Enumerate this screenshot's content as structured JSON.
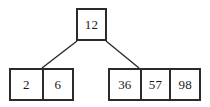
{
  "diagram": {
    "type": "b-tree",
    "colors": {
      "background": "#ffffff",
      "border": "#2b2b2b",
      "text": "#1a1a1a",
      "edge": "#2b2b2b"
    },
    "nodes": [
      {
        "id": "root",
        "role": "root-node",
        "keys": [
          "12"
        ]
      },
      {
        "id": "leaf-left",
        "role": "leaf-node",
        "keys": [
          "2",
          "6"
        ]
      },
      {
        "id": "leaf-right",
        "role": "leaf-node",
        "keys": [
          "36",
          "57",
          "98"
        ]
      }
    ],
    "edges": [
      {
        "id": "edge-root-to-left",
        "from": "root",
        "to": "leaf-left",
        "x1": 77,
        "y1": 41,
        "x2": 42,
        "y2": 68
      },
      {
        "id": "edge-root-to-right",
        "from": "root",
        "to": "leaf-right",
        "x1": 106,
        "y1": 41,
        "x2": 139,
        "y2": 68
      }
    ]
  }
}
